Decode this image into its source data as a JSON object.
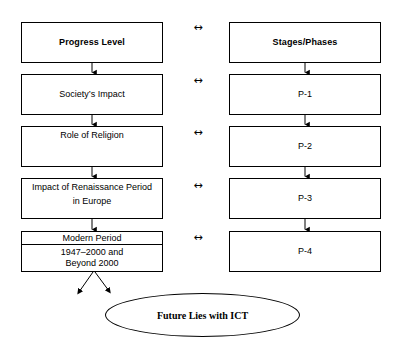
{
  "diagram": {
    "background_color": "#ffffff",
    "line_color": "#000000",
    "text_color": "#000000",
    "columns": {
      "left": {
        "name": "Progress Level",
        "header_label": "Progress Level",
        "items": [
          {
            "label": "Progress Level",
            "role": "header"
          },
          {
            "label": "Society’s Impact",
            "role": "stage"
          },
          {
            "label": "Role of Religion",
            "role": "stage"
          },
          {
            "label_line1": "Impact of Renaissance Period",
            "label_line2": "in Europe",
            "role": "stage"
          },
          {
            "heading": "Modern Period",
            "label_line1": "1947–2000 and",
            "label_line2": "Beyond 2000",
            "role": "stage"
          }
        ]
      },
      "right": {
        "name": "Stages/Phases",
        "header_label": "Stages/Phases",
        "items": [
          {
            "label": "Stages/Phases",
            "role": "header"
          },
          {
            "label": "P-1",
            "role": "phase"
          },
          {
            "label": "P-2",
            "role": "phase"
          },
          {
            "label": "P-3",
            "role": "phase"
          },
          {
            "label": "P-4",
            "role": "phase"
          }
        ]
      }
    },
    "connectors": {
      "bidirectional_glyph": "↔",
      "bidirectional_count": 5,
      "vertical_arrow_glyph": "↓",
      "vertical_arrows_left": 4,
      "vertical_arrows_right": 4,
      "diverging_arrows_from_modern_period": 2
    },
    "outcome": {
      "label": "Future Lies with ICT",
      "shape": "ellipse"
    }
  }
}
